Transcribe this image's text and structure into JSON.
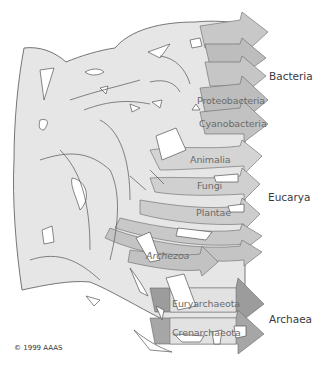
{
  "diagram": {
    "type": "tree-of-life-reticulate",
    "colors": {
      "body_fill": "#e6e6e6",
      "light_arrow": "#d2d2d2",
      "mid_arrow": "#bdbdbd",
      "dark_arrow": "#9a9a9a",
      "outline": "#555555",
      "label_text": "#6b6b6b",
      "domain_text": "#3a3a3a"
    },
    "domains": [
      {
        "name": "Bacteria",
        "lineages": [
          "Proteobacteria",
          "Cyanobacteria"
        ]
      },
      {
        "name": "Eucarya",
        "lineages": [
          "Animalia",
          "Fungi",
          "Plantae"
        ]
      },
      {
        "name": "Archaea",
        "lineages": [
          "Euryarchaeota",
          "Crenarchaeota"
        ]
      }
    ],
    "lineage_labels": {
      "proteobacteria": "Proteobacteria",
      "cyanobacteria": "Cyanobacteria",
      "animalia": "Animalia",
      "fungi": "Fungi",
      "plantae": "Plantae",
      "archezoa": "Archezoa",
      "euryarchaeota": "Euryarchaeota",
      "crenarchaeota": "Crenarchaeota"
    },
    "domain_labels": {
      "bacteria": "Bacteria",
      "eucarya": "Eucarya",
      "archaea": "Archaea"
    },
    "copyright": "© 1999 AAAS"
  }
}
